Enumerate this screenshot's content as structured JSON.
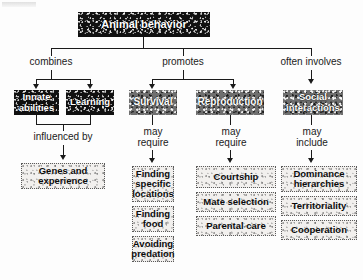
{
  "diagram": {
    "title": "Animal behavior",
    "root": {
      "label": "Animal behavior"
    },
    "connector_labels": {
      "combines": "combines",
      "promotes": "promotes",
      "often_involves": "often involves",
      "influenced_by": "influenced by",
      "may_require_survival": "may\nrequire",
      "may_require_reproduction": "may\nrequire",
      "may_include": "may\ninclude"
    },
    "branches": [
      {
        "id": "combines",
        "relation": "combines",
        "nodes": [
          {
            "label": "Innate\nabilities",
            "style": "dark"
          },
          {
            "label": "Learning",
            "style": "dark"
          }
        ],
        "sub_relation": "influenced by",
        "children": [
          {
            "label": "Genes and\nexperience",
            "style": "light"
          }
        ]
      },
      {
        "id": "promotes-survival",
        "relation": "promotes",
        "nodes": [
          {
            "label": "Survival",
            "style": "dark"
          }
        ],
        "sub_relation": "may require",
        "children": [
          {
            "label": "Finding\nspecific\nlocations",
            "style": "light"
          },
          {
            "label": "Finding\nfood",
            "style": "light"
          },
          {
            "label": "Avoiding\npredation",
            "style": "light"
          }
        ]
      },
      {
        "id": "promotes-reproduction",
        "relation": "promotes",
        "nodes": [
          {
            "label": "Reproduction",
            "style": "dark"
          }
        ],
        "sub_relation": "may require",
        "children": [
          {
            "label": "Courtship",
            "style": "light"
          },
          {
            "label": "Mate selection",
            "style": "light"
          },
          {
            "label": "Parental care",
            "style": "light"
          }
        ]
      },
      {
        "id": "often-involves-social",
        "relation": "often involves",
        "nodes": [
          {
            "label": "Social\ninteractions",
            "style": "dark"
          }
        ],
        "sub_relation": "may include",
        "children": [
          {
            "label": "Dominance\nhierarchies",
            "style": "light"
          },
          {
            "label": "Territoriality",
            "style": "light"
          },
          {
            "label": "Cooperation",
            "style": "light"
          }
        ]
      }
    ],
    "colors": {
      "line": "#1a1a1a",
      "dark_box_bg": "#111111",
      "dark_box_text": "#ffffff",
      "light_box_bg": "#f2f0ee",
      "light_box_text": "#0a0a0a",
      "page_bg": "#ffffff"
    }
  }
}
